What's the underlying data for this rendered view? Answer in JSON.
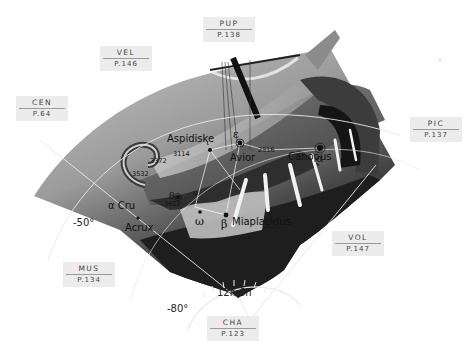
{
  "constellation": {
    "abbr": "CAR",
    "figure": "ship-argo-stern"
  },
  "neighbor_tags": [
    {
      "abbr": "PUP",
      "page": "P.138",
      "x": 203,
      "y": 17
    },
    {
      "abbr": "VEL",
      "page": "P.146",
      "x": 100,
      "y": 46
    },
    {
      "abbr": "CEN",
      "page": "P.64",
      "x": 16,
      "y": 96
    },
    {
      "abbr": "PIC",
      "page": "P.137",
      "x": 410,
      "y": 117
    },
    {
      "abbr": "VOL",
      "page": "P.147",
      "x": 330,
      "y": 231
    },
    {
      "abbr": "MUS",
      "page": "P.134",
      "x": 62,
      "y": 262
    },
    {
      "abbr": "CHA",
      "page": "P.123",
      "x": 207,
      "y": 316
    }
  ],
  "stars": [
    {
      "name": "Aspidiske",
      "greek": "ι"
    },
    {
      "name": "Avior",
      "greek": "ε"
    },
    {
      "name": "Canopus",
      "greek": "α"
    },
    {
      "name": "Miaplacidus",
      "greek": "β"
    },
    {
      "name": "Acrux",
      "greek": "α Cru"
    },
    {
      "name": "",
      "greek": "ω"
    },
    {
      "name": "",
      "greek": "θ"
    },
    {
      "name": "",
      "greek": "υ"
    }
  ],
  "labels": {
    "aspidiske": "Aspidiske",
    "avior": "Avior",
    "canopus": "Canopus",
    "miaplacidus": "Miaplacidus",
    "alpha_cru": "α Cru",
    "acrux": "Acrux",
    "greek_epsilon": "ε",
    "greek_iota": "ι",
    "greek_alpha": "α",
    "greek_beta": "β",
    "greek_omega": "ω",
    "greek_theta": "θ",
    "greek_upsilon": "υ",
    "num_3114": "3114",
    "num_3372": "3372",
    "num_3532": "3532",
    "num_2516": "2516",
    "num_3602": "3602"
  },
  "grid": {
    "dec_minus50": "-50°",
    "dec_minus80": "-80°",
    "ra_12h": "12h",
    "ra_6h": "6h"
  },
  "colors": {
    "sky_light": "#b9b9b9",
    "sky_mid": "#8d8d8d",
    "sky_dark": "#2a2a2a",
    "grid_line": "#e8e8e8",
    "tag_bg": "#ececec",
    "tag_text": "#444444"
  }
}
